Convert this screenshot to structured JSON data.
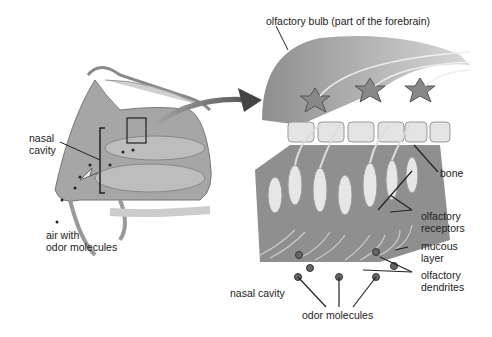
{
  "labels": {
    "olfactory_bulb": "olfactory bulb (part of the forebrain)",
    "nasal_cavity_left_1": "nasal",
    "nasal_cavity_left_2": "cavity",
    "air_1": "air with",
    "air_2": "odor molecules",
    "bone": "bone",
    "receptors_1": "olfactory",
    "receptors_2": "receptors",
    "mucous_1": "mucous",
    "mucous_2": "layer",
    "dendrites_1": "olfactory",
    "dendrites_2": "dendrites",
    "nasal_cavity_right": "nasal cavity",
    "odor_molecules": "odor molecules"
  },
  "colors": {
    "tissue": "#9a9a9a",
    "tissue_light": "#c9c9c9",
    "bone": "#e6e6e6",
    "cell": "#e8e8e8",
    "ink": "#222222"
  }
}
